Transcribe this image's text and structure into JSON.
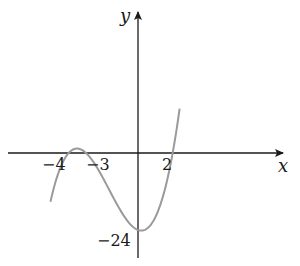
{
  "chart_data": {
    "type": "line",
    "title": "",
    "xlabel": "x",
    "ylabel": "y",
    "function": "y = (x+4)(x+3)(x-2)",
    "x_intercepts": [
      -4,
      -3,
      2
    ],
    "y_intercept": -24,
    "tick_labels": {
      "x": [
        "-4",
        "-3",
        "2"
      ],
      "y": [
        "-24"
      ]
    },
    "series": [
      {
        "name": "cubic curve",
        "color": "#9a9a9a",
        "points": [
          {
            "x": -5.05,
            "y": -44
          },
          {
            "x": -4,
            "y": 0
          },
          {
            "x": -3.5,
            "y": 2.8
          },
          {
            "x": -3,
            "y": 0
          },
          {
            "x": -2,
            "y": -8
          },
          {
            "x": -1,
            "y": -18
          },
          {
            "x": 0,
            "y": -24
          },
          {
            "x": 1,
            "y": -20
          },
          {
            "x": 2,
            "y": 0
          },
          {
            "x": 2.4,
            "y": 18
          }
        ]
      }
    ],
    "grid": false,
    "legend": "none",
    "axis_color": "#1a1a1a"
  },
  "labels": {
    "x_axis": "x",
    "y_axis": "y",
    "tick_neg4": "−4",
    "tick_neg3": "−3",
    "tick_2": "2",
    "tick_neg24": "−24"
  }
}
